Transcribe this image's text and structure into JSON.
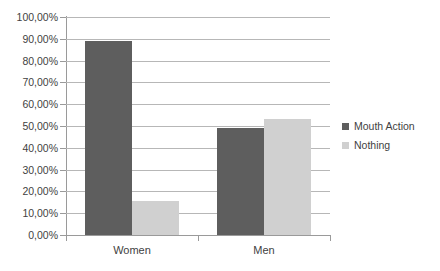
{
  "chart_data": {
    "type": "bar",
    "title": "",
    "subtitle": "",
    "xlabel": "",
    "ylabel": "",
    "categories": [
      "Women",
      "Men"
    ],
    "series": [
      {
        "name": "Mouth Action",
        "color": "#5e5e5e",
        "values": [
          89.0,
          49.0
        ]
      },
      {
        "name": "Nothing",
        "color": "#d0d0d0",
        "values": [
          15.5,
          53.0
        ]
      }
    ],
    "ylim": [
      0,
      100
    ],
    "ytick_step": 10,
    "ytick_labels": [
      "0,00%",
      "10,00%",
      "20,00%",
      "30,00%",
      "40,00%",
      "50,00%",
      "60,00%",
      "70,00%",
      "80,00%",
      "90,00%",
      "100,00%"
    ],
    "grid": "horizontal",
    "legend_position": "right",
    "value_suffix": "%",
    "decimal_separator": ","
  },
  "legend": {
    "items": [
      {
        "label": "Mouth Action"
      },
      {
        "label": "Nothing"
      }
    ]
  },
  "axis": {
    "x_categories": [
      {
        "label": "Women"
      },
      {
        "label": "Men"
      }
    ]
  },
  "colors": {
    "series_dark": "#5e5e5e",
    "series_light": "#d0d0d0",
    "gridline": "#b7b7b7",
    "axis": "#9a9a9a",
    "text": "#3f3f3f",
    "background": "#ffffff"
  }
}
